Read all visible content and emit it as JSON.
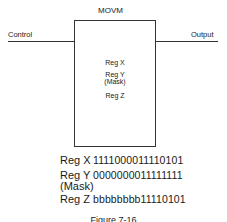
{
  "diagram": {
    "title": "MOVM",
    "input_label": "Control",
    "output_label": "Output",
    "inner_registers": [
      {
        "label": "Reg  X",
        "sublabel": ""
      },
      {
        "label": "Reg  Y",
        "sublabel": "(Mask)"
      },
      {
        "label": "Reg  Z",
        "sublabel": ""
      }
    ]
  },
  "register_table": [
    {
      "label": "Reg X",
      "sublabel": "",
      "value": "1111000011110101"
    },
    {
      "label": "Reg Y",
      "sublabel": "(Mask)",
      "value": "0000000011111111"
    },
    {
      "label": "Reg Z",
      "sublabel": "",
      "value": "bbbbbbbb11110101"
    }
  ],
  "caption": "Figure 7-16"
}
